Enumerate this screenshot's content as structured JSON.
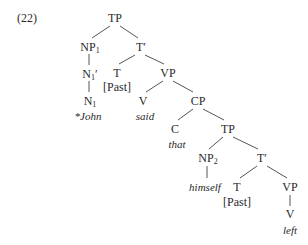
{
  "example_number": "(22)",
  "tree": {
    "root": {
      "label": "TP"
    },
    "np1": {
      "label": "NP",
      "sub": "1"
    },
    "n1bar": {
      "label": "N",
      "sub": "1",
      "bar": "′"
    },
    "n1": {
      "label": "N",
      "sub": "1"
    },
    "john": {
      "text": "*John"
    },
    "tbar1": {
      "label": "T′"
    },
    "t1": {
      "label": "T"
    },
    "past1": {
      "text": "[Past]"
    },
    "vp1": {
      "label": "VP"
    },
    "v1": {
      "label": "V"
    },
    "said": {
      "text": "said"
    },
    "cp": {
      "label": "CP"
    },
    "c": {
      "label": "C"
    },
    "that": {
      "text": "that"
    },
    "tp2": {
      "label": "TP"
    },
    "np2": {
      "label": "NP",
      "sub": "2"
    },
    "himself": {
      "text": "himself"
    },
    "tbar2": {
      "label": "T′"
    },
    "t2": {
      "label": "T"
    },
    "past2": {
      "text": "[Past]"
    },
    "vp2": {
      "label": "VP"
    },
    "v2": {
      "label": "V"
    },
    "left": {
      "text": "left"
    }
  }
}
